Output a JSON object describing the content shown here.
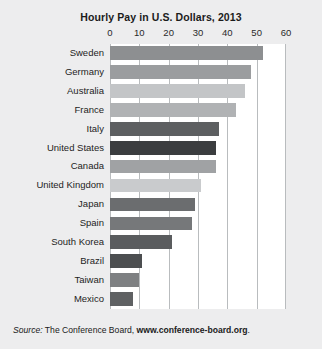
{
  "chart_data": {
    "type": "bar",
    "orientation": "horizontal",
    "title": "Hourly Pay in U.S. Dollars, 2013",
    "xlabel": "",
    "ylabel": "",
    "xlim": [
      0,
      60
    ],
    "xticks": [
      0,
      10,
      20,
      30,
      40,
      50,
      60
    ],
    "grid": true,
    "legend": false,
    "categories": [
      "Sweden",
      "Germany",
      "Australia",
      "France",
      "Italy",
      "United States",
      "Canada",
      "United Kingdom",
      "Japan",
      "Spain",
      "South Korea",
      "Brazil",
      "Taiwan",
      "Mexico"
    ],
    "values": [
      52,
      48,
      46,
      43,
      37,
      36,
      36,
      31,
      29,
      28,
      21,
      11,
      10,
      8
    ],
    "bar_colors": [
      "#8d8f91",
      "#9b9d9f",
      "#c3c5c7",
      "#b0b2b4",
      "#5d5f61",
      "#3b3d3f",
      "#a0a2a4",
      "#c9cbcd",
      "#6b6d6f",
      "#76787a",
      "#5a5c5e",
      "#4c4e50",
      "#7e8082",
      "#5f6163"
    ],
    "highlight_category": "United States",
    "source": {
      "prefix": "Source:",
      "publisher": "The Conference Board,",
      "url": "www.conference-board.org",
      "suffix": "."
    }
  }
}
